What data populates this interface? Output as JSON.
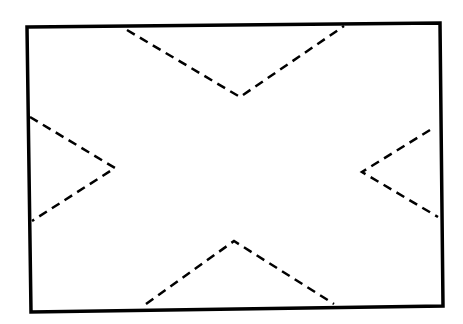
{
  "diagram": {
    "type": "envelope-fold-pattern",
    "background": "#ffffff",
    "stroke_color": "#000000",
    "outline": {
      "points": [
        [
          27,
          27
        ],
        [
          440,
          23
        ],
        [
          443,
          306
        ],
        [
          31,
          312
        ]
      ],
      "stroke_width": 3.5
    },
    "fold_lines": [
      {
        "name": "top-fold",
        "points": [
          [
            127,
            30
          ],
          [
            240,
            97
          ],
          [
            344,
            26
          ]
        ]
      },
      {
        "name": "left-fold",
        "points": [
          [
            30,
            117
          ],
          [
            115,
            168
          ],
          [
            32,
            221
          ]
        ]
      },
      {
        "name": "right-fold",
        "points": [
          [
            430,
            130
          ],
          [
            362,
            172
          ],
          [
            438,
            217
          ]
        ]
      },
      {
        "name": "bottom-fold",
        "points": [
          [
            146,
            304
          ],
          [
            234,
            241
          ],
          [
            334,
            304
          ]
        ]
      }
    ],
    "fold_stroke_width": 2.5,
    "dash_pattern": "9,6"
  }
}
